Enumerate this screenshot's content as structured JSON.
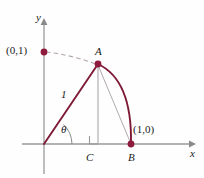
{
  "figure": {
    "background_color": "#fefefe",
    "axis_color": "#9a9a9a",
    "curve_color": "#7d1935",
    "point_color": "#8e1b3d",
    "thin_line_color": "#a09aa0",
    "dashed_color": "#a89aa0",
    "text_color": "#1a1a1a"
  },
  "axes": {
    "y_label": "y",
    "x_label": "x",
    "origin": {
      "x": 44,
      "y": 144
    },
    "x_axis": {
      "x1": 22,
      "y1": 144,
      "x2": 196,
      "y2": 144
    },
    "y_axis": {
      "x1": 44,
      "y1": 172,
      "x2": 44,
      "y2": 20
    }
  },
  "points": [
    {
      "name": "unit-y",
      "label": "(0,1)",
      "x": 44,
      "y": 52,
      "label_x": 6,
      "label_y": 45
    },
    {
      "name": "A",
      "label": "A",
      "x": 98,
      "y": 64,
      "label_x": 95,
      "label_y": 46
    },
    {
      "name": "B",
      "label": "B",
      "x": 131,
      "y": 144,
      "label_x": 128,
      "label_y": 152
    },
    {
      "name": "unit-x",
      "label": "(1,0)",
      "x": 131,
      "y": 144,
      "label_x": 133,
      "label_y": 124
    }
  ],
  "foot": {
    "name": "C",
    "label": "C",
    "x": 98,
    "y": 144,
    "label_x": 86,
    "label_y": 152
  },
  "segments": {
    "hypotenuse_label": "1",
    "angle_label": "θ",
    "radius_from": {
      "x": 44,
      "y": 144
    },
    "radius_to": {
      "x": 98,
      "y": 64
    },
    "vertical_from": {
      "x": 98,
      "y": 64
    },
    "vertical_to": {
      "x": 98,
      "y": 144
    },
    "chord_from": {
      "x": 98,
      "y": 64
    },
    "chord_to": {
      "x": 131,
      "y": 144
    }
  },
  "arcs": {
    "solid_arc_desc": "arc from A to B bulging right",
    "dashed_arc_desc": "dashed arc from (0,1) to A",
    "angle_arc_desc": "small arc marking angle theta at origin"
  },
  "right_angle_marker": {
    "x": 90,
    "y": 136,
    "size": 8
  }
}
